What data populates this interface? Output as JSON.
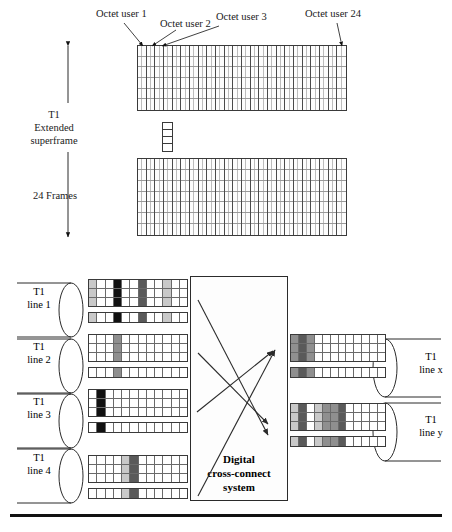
{
  "figure": {
    "background": "#ffffff",
    "line_color": "#2b2b2b"
  },
  "top_section": {
    "callouts": [
      {
        "id": "octet-user-1",
        "text": "Octet user 1"
      },
      {
        "id": "octet-user-2",
        "text": "Octet user 2"
      },
      {
        "id": "octet-user-3",
        "text": "Octet user 3"
      },
      {
        "id": "octet-user-24",
        "text": "Octet user 24"
      }
    ],
    "axis_label": "T1\nExtended\nsuperframe",
    "axis_label_lines": [
      "T1",
      "Extended",
      "superframe"
    ],
    "frames_label": "24 Frames",
    "grids": [
      {
        "id": "superframe-grid-top",
        "columns": 24,
        "subcells_per_column": 2,
        "rows": 6
      },
      {
        "id": "superframe-grid-bottom",
        "columns": 24,
        "subcells_per_column": 2,
        "rows": 7
      }
    ],
    "connector": {
      "id": "frame-connector-ladder",
      "rungs": 4
    }
  },
  "lower_section": {
    "input_lines": [
      {
        "id": "t1-line-1",
        "label_lines": [
          "T1",
          "line 1"
        ]
      },
      {
        "id": "t1-line-2",
        "label_lines": [
          "T1",
          "line 2"
        ]
      },
      {
        "id": "t1-line-3",
        "label_lines": [
          "T1",
          "line 3"
        ]
      },
      {
        "id": "t1-line-4",
        "label_lines": [
          "T1",
          "line 4"
        ]
      }
    ],
    "output_lines": [
      {
        "id": "t1-line-x",
        "label_lines": [
          "T1",
          "line x"
        ]
      },
      {
        "id": "t1-line-y",
        "label_lines": [
          "T1",
          "line y"
        ]
      }
    ],
    "cross_connect": {
      "id": "digital-cross-connect-system",
      "label_lines": [
        "Digital",
        "cross-connect",
        "system"
      ]
    },
    "palette": {
      "empty": "#ffffff",
      "light": "#c9c9c9",
      "medium": "#8f8f8f",
      "dark": "#5a5a5a",
      "black": "#111111"
    },
    "frame_patterns": {
      "t1-line-1": {
        "columns": 12,
        "stack_rows": [
          [
            "light",
            "empty",
            "empty",
            "black",
            "empty",
            "empty",
            "dark",
            "empty",
            "empty",
            "light",
            "empty",
            "empty"
          ],
          [
            "light",
            "empty",
            "empty",
            "black",
            "empty",
            "empty",
            "dark",
            "empty",
            "empty",
            "light",
            "empty",
            "empty"
          ],
          [
            "light",
            "empty",
            "empty",
            "black",
            "empty",
            "empty",
            "dark",
            "empty",
            "empty",
            "light",
            "empty",
            "empty"
          ]
        ],
        "strip_row": [
          "light",
          "empty",
          "empty",
          "black",
          "empty",
          "empty",
          "dark",
          "empty",
          "empty",
          "light",
          "empty",
          "empty"
        ]
      },
      "t1-line-2": {
        "columns": 12,
        "stack_rows": [
          [
            "empty",
            "empty",
            "empty",
            "medium",
            "empty",
            "empty",
            "empty",
            "empty",
            "empty",
            "empty",
            "empty",
            "empty"
          ],
          [
            "empty",
            "empty",
            "empty",
            "medium",
            "empty",
            "empty",
            "empty",
            "empty",
            "empty",
            "empty",
            "empty",
            "empty"
          ],
          [
            "empty",
            "empty",
            "empty",
            "medium",
            "empty",
            "empty",
            "empty",
            "empty",
            "empty",
            "empty",
            "empty",
            "empty"
          ]
        ],
        "strip_row": [
          "empty",
          "empty",
          "empty",
          "medium",
          "empty",
          "empty",
          "empty",
          "empty",
          "empty",
          "empty",
          "empty",
          "empty"
        ]
      },
      "t1-line-3": {
        "columns": 12,
        "stack_rows": [
          [
            "empty",
            "black",
            "empty",
            "empty",
            "empty",
            "empty",
            "empty",
            "empty",
            "empty",
            "empty",
            "empty",
            "empty"
          ],
          [
            "empty",
            "black",
            "empty",
            "empty",
            "empty",
            "empty",
            "empty",
            "empty",
            "empty",
            "empty",
            "empty",
            "empty"
          ],
          [
            "empty",
            "black",
            "empty",
            "empty",
            "empty",
            "empty",
            "empty",
            "empty",
            "empty",
            "empty",
            "empty",
            "empty"
          ]
        ],
        "strip_row": [
          "empty",
          "black",
          "empty",
          "empty",
          "empty",
          "empty",
          "empty",
          "empty",
          "empty",
          "empty",
          "empty",
          "empty"
        ]
      },
      "t1-line-4": {
        "columns": 12,
        "stack_rows": [
          [
            "empty",
            "empty",
            "empty",
            "empty",
            "light",
            "dark",
            "empty",
            "empty",
            "empty",
            "empty",
            "empty",
            "empty"
          ],
          [
            "empty",
            "empty",
            "empty",
            "empty",
            "light",
            "dark",
            "empty",
            "empty",
            "empty",
            "empty",
            "empty",
            "empty"
          ],
          [
            "empty",
            "empty",
            "empty",
            "empty",
            "light",
            "dark",
            "empty",
            "empty",
            "empty",
            "empty",
            "empty",
            "empty"
          ]
        ],
        "strip_row": [
          "empty",
          "empty",
          "empty",
          "empty",
          "light",
          "dark",
          "empty",
          "empty",
          "empty",
          "empty",
          "empty",
          "empty"
        ]
      },
      "t1-line-x": {
        "columns": 12,
        "stack_rows": [
          [
            "medium",
            "dark",
            "medium",
            "empty",
            "empty",
            "empty",
            "empty",
            "empty",
            "empty",
            "empty",
            "empty",
            "empty"
          ],
          [
            "medium",
            "dark",
            "medium",
            "empty",
            "empty",
            "empty",
            "empty",
            "empty",
            "empty",
            "empty",
            "empty",
            "empty"
          ],
          [
            "medium",
            "dark",
            "medium",
            "empty",
            "empty",
            "empty",
            "empty",
            "empty",
            "empty",
            "empty",
            "empty",
            "empty"
          ]
        ],
        "strip_row": [
          "medium",
          "dark",
          "medium",
          "empty",
          "empty",
          "empty",
          "empty",
          "empty",
          "empty",
          "empty",
          "empty",
          "empty"
        ]
      },
      "t1-line-y": {
        "columns": 12,
        "stack_rows": [
          [
            "light",
            "dark",
            "empty",
            "light",
            "medium",
            "medium",
            "dark",
            "empty",
            "empty",
            "empty",
            "empty",
            "empty"
          ],
          [
            "light",
            "dark",
            "empty",
            "light",
            "medium",
            "medium",
            "dark",
            "empty",
            "empty",
            "empty",
            "empty",
            "empty"
          ],
          [
            "light",
            "dark",
            "empty",
            "light",
            "medium",
            "medium",
            "dark",
            "empty",
            "empty",
            "empty",
            "empty",
            "empty"
          ]
        ],
        "strip_row": [
          "light",
          "dark",
          "empty",
          "light",
          "medium",
          "medium",
          "dark",
          "empty",
          "empty",
          "empty",
          "empty",
          "empty"
        ]
      }
    },
    "cross_connect_arrows": 4
  }
}
